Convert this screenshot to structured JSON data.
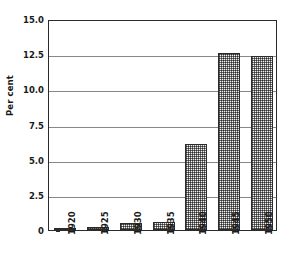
{
  "chart_data": {
    "type": "bar",
    "title": "",
    "subtitle": "",
    "xlabel": "",
    "ylabel": "Per cent",
    "categories": [
      "1920",
      "1925",
      "1930",
      "1935",
      "1940",
      "1945",
      "1950"
    ],
    "values": [
      0.15,
      0.2,
      0.5,
      0.6,
      6.1,
      12.6,
      12.4
    ],
    "series": [
      {
        "name": "Per cent",
        "values": [
          0.15,
          0.2,
          0.5,
          0.6,
          6.1,
          12.6,
          12.4
        ]
      }
    ],
    "ylim": [
      0,
      15.0
    ],
    "ytick_labels": [
      "0",
      "2.5",
      "5.0",
      "7.5",
      "10.0",
      "12.5",
      "15.0"
    ],
    "ytick_values": [
      0,
      2.5,
      5.0,
      7.5,
      10.0,
      12.5,
      15.0
    ],
    "xtick_labels": [
      "1920",
      "1925",
      "1930",
      "1935",
      "1940",
      "1945",
      "1950"
    ],
    "grid": "horizontal",
    "legend": "none",
    "legend_position": "none",
    "annotations": [],
    "bar_fill": "gray-checker-pattern",
    "bar_edge_color": "#2b2b2b",
    "grid_color": "#878787",
    "frame_color": "#2b2b2b",
    "background_color": "#ffffff",
    "xtick_label_rotation": 90
  }
}
